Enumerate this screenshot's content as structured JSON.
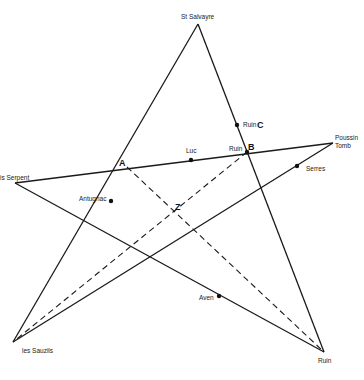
{
  "diagram": {
    "type": "pentagram-map",
    "places": {
      "st_salvayre": "St Salvayre",
      "is_serpent": "is Serpent",
      "poussin_tomb_line1": "Poussin",
      "poussin_tomb_line2": "Tomb",
      "les_sauzils": "les Sauzils",
      "ruin_bottom": "Ruin",
      "luc": "Luc",
      "ruin_b": "Ruin",
      "ruin_c": "Ruin",
      "antugnac": "Antugnac",
      "serres": "Serres",
      "aven": "Aven"
    },
    "points": {
      "a": "A",
      "b": "B",
      "c": "C",
      "z": "Z"
    }
  }
}
